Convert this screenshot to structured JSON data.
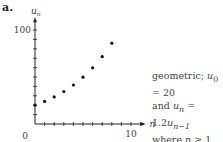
{
  "panel_label": "a.",
  "caption": {
    "line1_prefix": "geometric; ",
    "line1_var": "u",
    "line1_sub": "0",
    "line1_suffix": " = 20",
    "line2_prefix": "and ",
    "line2_var": "u",
    "line2_sub": "n",
    "line2_mid": " = 1.2",
    "line2_var2": "u",
    "line2_sub2": "n−1",
    "line3_prefix": "where ",
    "line3_var": "n",
    "line3_suffix": " ≥ 1"
  },
  "chart_data": {
    "type": "scatter",
    "title": "",
    "xlabel": "n",
    "ylabel": "u_n",
    "x": [
      0,
      1,
      2,
      3,
      4,
      5,
      6,
      7,
      8
    ],
    "y": [
      20,
      24,
      28.8,
      34.56,
      41.47,
      49.77,
      59.72,
      71.66,
      86.0
    ],
    "xlim": [
      0,
      11
    ],
    "ylim": [
      0,
      105
    ],
    "x_ticks": [
      0,
      1,
      2,
      3,
      4,
      5,
      6,
      7,
      8,
      9,
      10,
      11
    ],
    "x_tick_labels": {
      "0": "0",
      "10": "10"
    },
    "y_ticks": [
      10,
      20,
      30,
      40,
      50,
      60,
      70,
      80,
      90,
      100
    ],
    "y_tick_labels": {
      "100": "100"
    },
    "origin_label": "0",
    "grid": false,
    "legend": null
  }
}
